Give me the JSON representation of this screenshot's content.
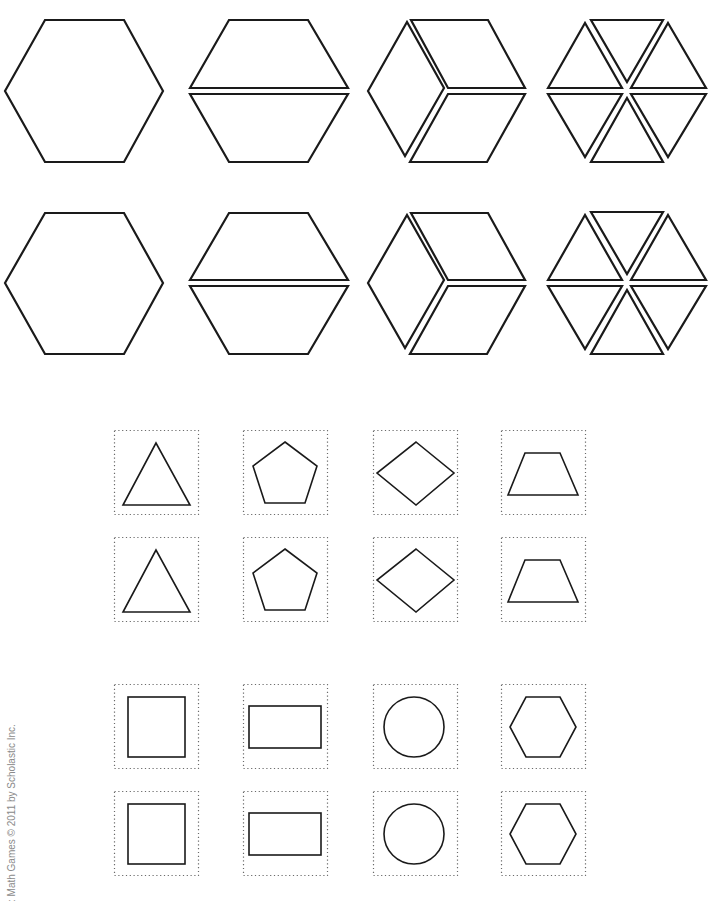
{
  "page": {
    "credit": ": Math Games © 2011 by Scholastic Inc."
  },
  "style": {
    "stroke": "#1a1a1a",
    "card_border": "#6a6a6a",
    "background": "#ffffff"
  },
  "hexagon_rows": [
    {
      "y_center": 91,
      "pieces": [
        {
          "name": "hexagon-whole",
          "cx": 84,
          "polys": [
            [
              [
                5,
                91
              ],
              [
                45,
                20
              ],
              [
                124,
                20
              ],
              [
                163,
                91
              ],
              [
                124,
                162
              ],
              [
                45,
                162
              ]
            ]
          ]
        },
        {
          "name": "hexagon-split-trapezoids",
          "cx": 269,
          "polys": [
            [
              [
                190,
                88
              ],
              [
                229,
                20
              ],
              [
                308,
                20
              ],
              [
                348,
                88
              ]
            ],
            [
              [
                190,
                94
              ],
              [
                348,
                94
              ],
              [
                308,
                162
              ],
              [
                229,
                162
              ]
            ]
          ]
        },
        {
          "name": "hexagon-split-rhombi",
          "cx": 446,
          "polys": [
            [
              [
                368,
                91
              ],
              [
                407,
                22
              ],
              [
                444,
                88
              ],
              [
                405,
                156
              ]
            ],
            [
              [
                411,
                20
              ],
              [
                488,
                20
              ],
              [
                525,
                88
              ],
              [
                448,
                88
              ]
            ],
            [
              [
                448,
                94
              ],
              [
                525,
                94
              ],
              [
                487,
                162
              ],
              [
                410,
                162
              ]
            ]
          ]
        },
        {
          "name": "hexagon-split-triangles",
          "cx": 627,
          "polys": [
            [
              [
                548,
                88
              ],
              [
                585,
                23
              ],
              [
                622,
                88
              ]
            ],
            [
              [
                591,
                20
              ],
              [
                663,
                20
              ],
              [
                627,
                82
              ]
            ],
            [
              [
                668,
                23
              ],
              [
                706,
                88
              ],
              [
                631,
                88
              ]
            ],
            [
              [
                548,
                94
              ],
              [
                622,
                94
              ],
              [
                585,
                157
              ]
            ],
            [
              [
                627,
                98
              ],
              [
                663,
                162
              ],
              [
                591,
                162
              ]
            ],
            [
              [
                631,
                94
              ],
              [
                706,
                94
              ],
              [
                668,
                157
              ]
            ]
          ]
        }
      ]
    },
    {
      "y_center": 284,
      "pieces": [
        {
          "name": "hexagon-whole",
          "cx": 84,
          "polys": [
            [
              [
                5,
                283
              ],
              [
                45,
                213
              ],
              [
                124,
                213
              ],
              [
                163,
                283
              ],
              [
                124,
                354
              ],
              [
                45,
                354
              ]
            ]
          ]
        },
        {
          "name": "hexagon-split-trapezoids",
          "cx": 269,
          "polys": [
            [
              [
                190,
                280
              ],
              [
                229,
                213
              ],
              [
                308,
                213
              ],
              [
                348,
                280
              ]
            ],
            [
              [
                190,
                286
              ],
              [
                348,
                286
              ],
              [
                308,
                354
              ],
              [
                229,
                354
              ]
            ]
          ]
        },
        {
          "name": "hexagon-split-rhombi",
          "cx": 446,
          "polys": [
            [
              [
                368,
                283
              ],
              [
                407,
                215
              ],
              [
                444,
                280
              ],
              [
                405,
                348
              ]
            ],
            [
              [
                411,
                213
              ],
              [
                488,
                213
              ],
              [
                525,
                280
              ],
              [
                448,
                280
              ]
            ],
            [
              [
                448,
                286
              ],
              [
                525,
                286
              ],
              [
                487,
                354
              ],
              [
                410,
                354
              ]
            ]
          ]
        },
        {
          "name": "hexagon-split-triangles",
          "cx": 627,
          "polys": [
            [
              [
                548,
                280
              ],
              [
                585,
                215
              ],
              [
                622,
                280
              ]
            ],
            [
              [
                591,
                212
              ],
              [
                663,
                212
              ],
              [
                627,
                274
              ]
            ],
            [
              [
                668,
                215
              ],
              [
                706,
                280
              ],
              [
                631,
                280
              ]
            ],
            [
              [
                548,
                286
              ],
              [
                622,
                286
              ],
              [
                585,
                349
              ]
            ],
            [
              [
                627,
                290
              ],
              [
                663,
                354
              ],
              [
                591,
                354
              ]
            ],
            [
              [
                631,
                286
              ],
              [
                706,
                286
              ],
              [
                668,
                349
              ]
            ]
          ]
        }
      ]
    }
  ],
  "cards": {
    "size": 84,
    "columns_x": [
      114,
      243,
      373,
      501
    ],
    "rows_y": [
      430,
      537,
      684,
      791
    ],
    "rows": [
      [
        "triangle",
        "pentagon",
        "rhombus",
        "trapezoid"
      ],
      [
        "triangle",
        "pentagon",
        "rhombus",
        "trapezoid"
      ],
      [
        "square",
        "rectangle",
        "circle",
        "hexagon"
      ],
      [
        "square",
        "rectangle",
        "circle",
        "hexagon"
      ]
    ],
    "shapes": {
      "triangle": {
        "type": "poly",
        "pts": [
          [
            42,
            13
          ],
          [
            9,
            75
          ],
          [
            76,
            75
          ]
        ]
      },
      "pentagon": {
        "type": "poly",
        "pts": [
          [
            42,
            12
          ],
          [
            74,
            36
          ],
          [
            62,
            73
          ],
          [
            22,
            73
          ],
          [
            10,
            36
          ]
        ]
      },
      "rhombus": {
        "type": "poly",
        "pts": [
          [
            43,
            12
          ],
          [
            81,
            43
          ],
          [
            43,
            75
          ],
          [
            4,
            43
          ]
        ]
      },
      "trapezoid": {
        "type": "poly",
        "pts": [
          [
            24,
            23
          ],
          [
            59,
            23
          ],
          [
            77,
            65
          ],
          [
            7,
            65
          ]
        ]
      },
      "square": {
        "type": "rect",
        "x": 14,
        "y": 13,
        "w": 57,
        "h": 60
      },
      "rectangle": {
        "type": "rect",
        "x": 6,
        "y": 22,
        "w": 72,
        "h": 42
      },
      "circle": {
        "type": "circle",
        "cx": 41,
        "cy": 43,
        "r": 30
      },
      "hexagon": {
        "type": "poly",
        "pts": [
          [
            25,
            13
          ],
          [
            59,
            13
          ],
          [
            75,
            43
          ],
          [
            59,
            73
          ],
          [
            25,
            73
          ],
          [
            9,
            43
          ]
        ]
      }
    }
  }
}
